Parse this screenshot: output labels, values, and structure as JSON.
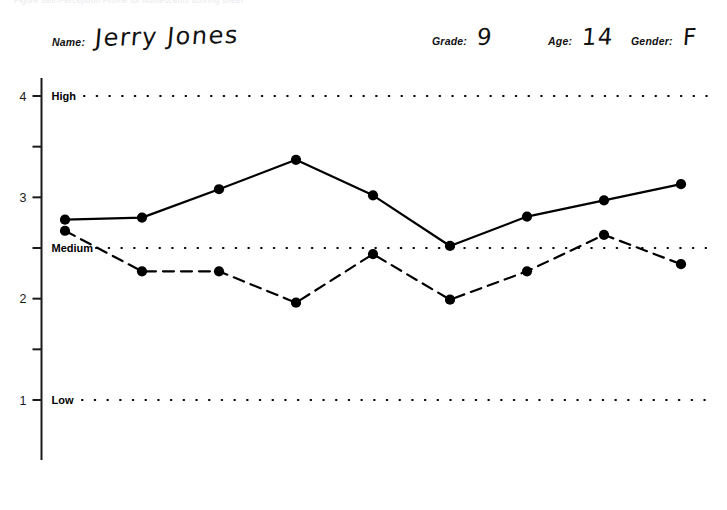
{
  "top_caption": "Figure     Self-Perception Profile for Adolescents scoring sheet",
  "form": {
    "fields": [
      {
        "name": "name",
        "label": "Name:",
        "value": "Jerry Jones"
      },
      {
        "name": "grade",
        "label": "Grade:",
        "value": "9"
      },
      {
        "name": "age",
        "label": "Age:",
        "value": "14"
      },
      {
        "name": "gender",
        "label": "Gender:",
        "value": "F"
      }
    ]
  },
  "chart_data": {
    "type": "line",
    "title": "",
    "xlabel": "",
    "ylabel": "",
    "ylim": [
      0.65,
      4.35
    ],
    "grid": false,
    "legend_position": "none",
    "categories": [
      "Scholastic competence",
      "Athletic competence",
      "Job competence",
      "Close friendship",
      "Social acceptance",
      "Romantic appeal",
      "Physical appearance",
      "Behavioral conduct",
      "Global self-worth"
    ],
    "category_lines": [
      [
        "Scholastic",
        "competence"
      ],
      [
        "Athletic",
        "competence"
      ],
      [
        "Job",
        "competence"
      ],
      [
        "Close",
        "friendship"
      ],
      [
        "Social",
        "acceptance"
      ],
      [
        "Romantic",
        "appeal"
      ],
      [
        "Physical",
        "appearance"
      ],
      [
        "Behavioral",
        "conduct"
      ],
      [
        "Global",
        "self-worth"
      ]
    ],
    "y_major_ticks": [
      1,
      2,
      3,
      4
    ],
    "y_minor_ticks": [
      1.5,
      2.5,
      3.5
    ],
    "y_tick_labels": [
      "1",
      "2",
      "3",
      "4"
    ],
    "anchor_labels": [
      {
        "text": "High",
        "value": 4
      },
      {
        "text": "Medium",
        "value": 2.5
      },
      {
        "text": "Low",
        "value": 1
      }
    ],
    "reference_lines": [
      {
        "label": "High",
        "value": 4,
        "style": "dotted"
      },
      {
        "label": "Medium",
        "value": 2.5,
        "style": "dotted"
      },
      {
        "label": "Low",
        "value": 1,
        "style": "dotted"
      }
    ],
    "series": [
      {
        "name": "Importance ratings",
        "style": "solid",
        "marker": "filled-circle",
        "values": [
          2.78,
          2.8,
          3.08,
          3.37,
          3.02,
          2.52,
          2.81,
          2.97,
          3.13
        ]
      },
      {
        "name": "Competence ratings",
        "style": "dashed",
        "marker": "filled-circle",
        "values": [
          2.67,
          2.27,
          2.27,
          1.96,
          2.44,
          1.99,
          2.27,
          2.63,
          2.34
        ]
      }
    ]
  },
  "colors": {
    "ink": "#000000",
    "axis": "#1a1a1a",
    "background": "#ffffff"
  }
}
